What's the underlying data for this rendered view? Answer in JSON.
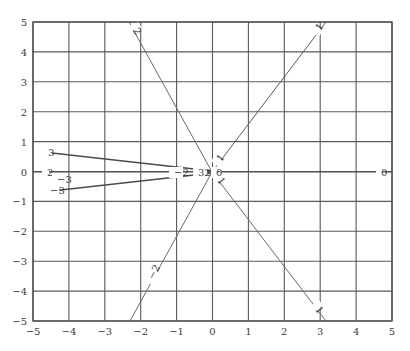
{
  "chart_data": {
    "type": "line",
    "title": "",
    "xlabel": "",
    "ylabel": "",
    "xlim": [
      -5,
      5
    ],
    "ylim": [
      -5,
      5
    ],
    "grid": true,
    "x_ticks": [
      -5,
      -4,
      -3,
      -2,
      -1,
      0,
      1,
      2,
      3,
      4,
      5
    ],
    "y_ticks": [
      -5,
      -4,
      -3,
      -2,
      -1,
      0,
      1,
      2,
      3,
      4,
      5
    ],
    "x_tick_labels": [
      "−5",
      "−4",
      "−3",
      "−2",
      "−1",
      "0",
      "1",
      "2",
      "3",
      "4",
      "5"
    ],
    "y_tick_labels": [
      "−5",
      "−4",
      "−3",
      "−2",
      "−1",
      "0",
      "1",
      "2",
      "3",
      "4",
      "5"
    ],
    "series": [
      {
        "name": "level 1",
        "label": "1",
        "points": [
          [
            0,
            0
          ],
          [
            3.2,
            5
          ]
        ],
        "end_labels": [
          "1",
          "1"
        ],
        "color": "#5a5a5a"
      },
      {
        "name": "level -1",
        "label": "1",
        "points": [
          [
            0,
            0
          ],
          [
            3.2,
            -5
          ]
        ],
        "end_labels": [
          "1",
          "1"
        ],
        "color": "#6a6a6a"
      },
      {
        "name": "level 2",
        "label": "2",
        "points": [
          [
            0,
            0
          ],
          [
            -2.3,
            5
          ]
        ],
        "end_labels": [
          "2",
          "2"
        ],
        "color": "#6a6a6a"
      },
      {
        "name": "level -2",
        "label": "−2",
        "points": [
          [
            0,
            0
          ],
          [
            -2.3,
            -5
          ]
        ],
        "end_labels": [
          "−2",
          "−2"
        ],
        "color": "#6a6a6a"
      },
      {
        "name": "level 3",
        "label": "3",
        "points": [
          [
            0,
            0
          ],
          [
            -5,
            0.7
          ]
        ],
        "end_labels": [
          "3",
          "3"
        ],
        "color": "#4a4a4a"
      },
      {
        "name": "level -3",
        "label": "−3",
        "points": [
          [
            0,
            0
          ],
          [
            -5,
            -0.7
          ]
        ],
        "end_labels": [
          "−3",
          "−3"
        ],
        "color": "#4a4a4a"
      },
      {
        "name": "level 0",
        "label": "0",
        "points": [
          [
            0,
            0
          ],
          [
            5,
            0
          ]
        ],
        "end_labels": [
          "0",
          "0"
        ],
        "color": "#4a4a4a"
      },
      {
        "name": "level 2 (horizontal)",
        "label": "2",
        "points": [
          [
            -5,
            0
          ],
          [
            0,
            0
          ]
        ],
        "end_labels": [
          "2",
          "−2"
        ],
        "color": "#4a4a4a"
      }
    ],
    "annotations": [
      {
        "text": "1",
        "x": 3.0,
        "y": 4.6
      },
      {
        "text": "1",
        "x": 0.3,
        "y": 0.45
      },
      {
        "text": "1",
        "x": 0.3,
        "y": -0.45
      },
      {
        "text": "1",
        "x": 3.0,
        "y": -4.6
      },
      {
        "text": "2",
        "x": -2.05,
        "y": 4.55
      },
      {
        "text": "−2",
        "x": -1.9,
        "y": -3.6
      },
      {
        "text": "3",
        "x": -4.6,
        "y": 0.65
      },
      {
        "text": "−3",
        "x": -4.6,
        "y": -0.65
      },
      {
        "text": "2",
        "x": -4.6,
        "y": 0.0
      },
      {
        "text": "−3",
        "x": -4.35,
        "y": -0.15
      },
      {
        "text": "−2",
        "x": -1.05,
        "y": 0.0
      },
      {
        "text": "32",
        "x": -0.4,
        "y": 0.0
      },
      {
        "text": "0",
        "x": 0.2,
        "y": 0.0
      },
      {
        "text": "0",
        "x": 4.6,
        "y": 0.0
      }
    ]
  }
}
